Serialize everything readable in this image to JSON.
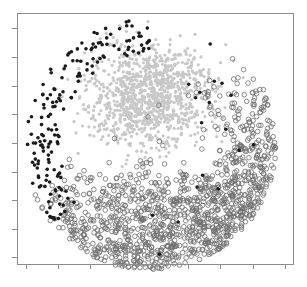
{
  "chart_data": {
    "type": "scatter",
    "title": "",
    "xlabel": "",
    "ylabel": "",
    "x_tick_labels": [],
    "y_tick_labels": [],
    "grid": false,
    "legend": null,
    "frame": {
      "left": 17,
      "top": 13,
      "right": 293,
      "bottom": 264,
      "color": "#8c8c8c"
    },
    "x_ticks_px": [
      26,
      58,
      90,
      123,
      155,
      188,
      220,
      253,
      285
    ],
    "y_ticks_px": [
      28,
      57,
      86,
      114,
      143,
      172,
      200,
      229,
      257
    ],
    "tick_length": 5,
    "disc": {
      "cx": 150,
      "cy": 144,
      "r": 126
    },
    "series": [
      {
        "name": "light-gray-filled",
        "marker": "filled-circle",
        "color": "#c8c8c8",
        "stroke": "none",
        "radius": 1.6,
        "count": 1100,
        "region": "upper-center lobe of disc (angles roughly 190°–360° plus interior), sparser toward lower-right"
      },
      {
        "name": "open-circle",
        "marker": "open-circle",
        "color": "none",
        "stroke": "#6e6e6e",
        "radius": 2.3,
        "count": 1250,
        "region": "lower half and right arc of disc, densest bottom-right"
      },
      {
        "name": "solid-black",
        "marker": "filled-circle",
        "color": "#1a1a1a",
        "stroke": "none",
        "radius": 1.8,
        "count": 170,
        "region": "left arc of disc from top-left down to bottom-center, few scattered on right"
      }
    ]
  }
}
